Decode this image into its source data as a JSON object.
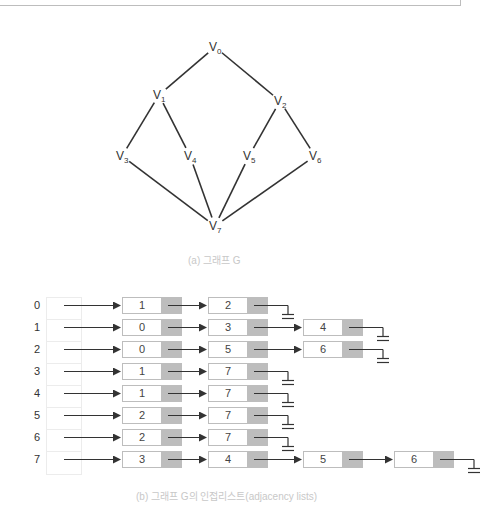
{
  "graph": {
    "caption": "(a) 그래프 G",
    "vertices": [
      {
        "id": "V0",
        "base": "V",
        "sub": "0",
        "x": 215,
        "y": 47
      },
      {
        "id": "V1",
        "base": "V",
        "sub": "1",
        "x": 159,
        "y": 95
      },
      {
        "id": "V2",
        "base": "V",
        "sub": "2",
        "x": 280,
        "y": 101
      },
      {
        "id": "V3",
        "base": "V",
        "sub": "3",
        "x": 122,
        "y": 156
      },
      {
        "id": "V4",
        "base": "V",
        "sub": "4",
        "x": 190,
        "y": 156
      },
      {
        "id": "V5",
        "base": "V",
        "sub": "5",
        "x": 249,
        "y": 156
      },
      {
        "id": "V6",
        "base": "V",
        "sub": "6",
        "x": 315,
        "y": 156
      },
      {
        "id": "V7",
        "base": "V",
        "sub": "7",
        "x": 215,
        "y": 226
      }
    ],
    "edges": [
      [
        "V0",
        "V1"
      ],
      [
        "V0",
        "V2"
      ],
      [
        "V1",
        "V3"
      ],
      [
        "V1",
        "V4"
      ],
      [
        "V2",
        "V5"
      ],
      [
        "V2",
        "V6"
      ],
      [
        "V3",
        "V7"
      ],
      [
        "V4",
        "V7"
      ],
      [
        "V5",
        "V7"
      ],
      [
        "V6",
        "V7"
      ]
    ]
  },
  "adjacency": {
    "caption": "(b) 그래프 G의 인접리스트(adjacency lists)",
    "rows": [
      {
        "index": "0",
        "list": [
          "1",
          "2"
        ]
      },
      {
        "index": "1",
        "list": [
          "0",
          "3",
          "4"
        ]
      },
      {
        "index": "2",
        "list": [
          "0",
          "5",
          "6"
        ]
      },
      {
        "index": "3",
        "list": [
          "1",
          "7"
        ]
      },
      {
        "index": "4",
        "list": [
          "1",
          "7"
        ]
      },
      {
        "index": "5",
        "list": [
          "2",
          "7"
        ]
      },
      {
        "index": "6",
        "list": [
          "2",
          "7"
        ]
      },
      {
        "index": "7",
        "list": [
          "3",
          "4",
          "5",
          "6"
        ]
      }
    ]
  },
  "colors": {
    "line": "#333333",
    "pointer_cell": "#bdbdbd",
    "caption": "#c8c8c8"
  }
}
